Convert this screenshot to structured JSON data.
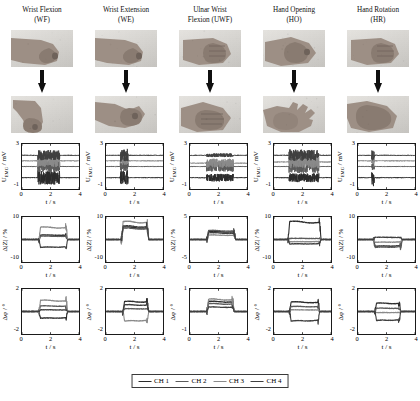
{
  "figure": {
    "columns": [
      {
        "id": "WF",
        "title_line1": "Wrist Flexion",
        "title_line2": "(WF)"
      },
      {
        "id": "WE",
        "title_line1": "Wrist Extension",
        "title_line2": "(WE)"
      },
      {
        "id": "UWF",
        "title_line1": "Ulnar Wrist",
        "title_line2": "Flexion (UWF)"
      },
      {
        "id": "HO",
        "title_line1": "Hand Opening",
        "title_line2": "(HO)"
      },
      {
        "id": "HR",
        "title_line1": "Hand Rotation",
        "title_line2": "(HR)"
      }
    ],
    "photo_rows": [
      {
        "name": "rest-posture",
        "cells": [
          "fist-side-rest",
          "fist-side-rest",
          "fist-front-rest",
          "fist-angled-rest",
          "fist-front-rest"
        ]
      },
      {
        "name": "gesture-posture",
        "cells": [
          "wrist-flexed-down",
          "wrist-extended-up",
          "ulnar-flexed-fist",
          "open-palm-hand",
          "rotated-fist"
        ]
      }
    ],
    "arrow_label": "transition-arrow",
    "legend": {
      "items": [
        {
          "label": "CH 1",
          "color": "#2b2b2b"
        },
        {
          "label": "CH 2",
          "color": "#5a5a5a"
        },
        {
          "label": "CH 3",
          "color": "#8a8a8a"
        },
        {
          "label": "CH 4",
          "color": "#3f3f3f"
        }
      ]
    }
  },
  "chart_data": [
    {
      "type": "line",
      "row": "emg",
      "column": "WF",
      "title": "",
      "xlabel": "t / s",
      "ylabel": "U_EMG / mV",
      "xlim": [
        0,
        4
      ],
      "ylim": [
        -1,
        3
      ],
      "xticks": [
        0,
        2,
        4
      ],
      "yticks": [
        -1,
        3
      ],
      "ytick_labels": [
        "-1",
        "3"
      ],
      "grid": false,
      "burst_window": [
        1.15,
        2.6
      ],
      "series": [
        {
          "name": "CH 1",
          "color": "#2b2b2b",
          "baseline": 0.0,
          "burst_amplitude": 0.55
        },
        {
          "name": "CH 2",
          "color": "#5a5a5a",
          "baseline": 1.0,
          "burst_amplitude": 0.45
        },
        {
          "name": "CH 3",
          "color": "#8a8a8a",
          "baseline": 1.5,
          "burst_amplitude": 0.5
        },
        {
          "name": "CH 4",
          "color": "#3f3f3f",
          "baseline": 2.0,
          "burst_amplitude": 0.4
        }
      ]
    },
    {
      "type": "line",
      "row": "emg",
      "column": "WE",
      "xlabel": "t / s",
      "ylabel": "U_EMG / mV",
      "xlim": [
        0,
        4
      ],
      "ylim": [
        -1,
        3
      ],
      "xticks": [
        0,
        2,
        4
      ],
      "ytick_labels": [
        "-1",
        "3"
      ],
      "burst_window": [
        1.05,
        1.5
      ],
      "series": [
        {
          "name": "CH 1",
          "color": "#2b2b2b",
          "baseline": 0.0,
          "burst_amplitude": 0.6
        },
        {
          "name": "CH 2",
          "color": "#5a5a5a",
          "baseline": 1.0,
          "burst_amplitude": 0.35
        },
        {
          "name": "CH 3",
          "color": "#8a8a8a",
          "baseline": 1.5,
          "burst_amplitude": 0.3
        },
        {
          "name": "CH 4",
          "color": "#3f3f3f",
          "baseline": 2.0,
          "burst_amplitude": 0.5
        }
      ]
    },
    {
      "type": "line",
      "row": "emg",
      "column": "UWF",
      "xlabel": "t / s",
      "ylabel": "U_EMG / mV",
      "xlim": [
        0,
        4
      ],
      "ylim": [
        -1,
        3
      ],
      "xticks": [
        0,
        2,
        4
      ],
      "ytick_labels": [
        "-1",
        "3"
      ],
      "burst_window": [
        1.2,
        3.0
      ],
      "series": [
        {
          "name": "CH 1",
          "color": "#2b2b2b",
          "baseline": 0.0,
          "burst_amplitude": 0.3
        },
        {
          "name": "CH 2",
          "color": "#5a5a5a",
          "baseline": 1.0,
          "burst_amplitude": 0.4
        },
        {
          "name": "CH 3",
          "color": "#8a8a8a",
          "baseline": 1.3,
          "burst_amplitude": 0.35
        },
        {
          "name": "CH 4",
          "color": "#3f3f3f",
          "baseline": 2.0,
          "burst_amplitude": 0.12
        }
      ]
    },
    {
      "type": "line",
      "row": "emg",
      "column": "HO",
      "xlabel": "t / s",
      "ylabel": "U_EMG / mV",
      "xlim": [
        0,
        4
      ],
      "ylim": [
        -1,
        3
      ],
      "xticks": [
        0,
        2,
        4
      ],
      "ytick_labels": [
        "-1",
        "3"
      ],
      "burst_window": [
        1.1,
        3.1
      ],
      "series": [
        {
          "name": "CH 1",
          "color": "#2b2b2b",
          "baseline": 0.0,
          "burst_amplitude": 0.35
        },
        {
          "name": "CH 2",
          "color": "#5a5a5a",
          "baseline": 1.0,
          "burst_amplitude": 0.55
        },
        {
          "name": "CH 3",
          "color": "#8a8a8a",
          "baseline": 1.4,
          "burst_amplitude": 0.5
        },
        {
          "name": "CH 4",
          "color": "#3f3f3f",
          "baseline": 2.0,
          "burst_amplitude": 0.45
        }
      ]
    },
    {
      "type": "line",
      "row": "emg",
      "column": "HR",
      "xlabel": "t / s",
      "ylabel": "U_EMG / mV",
      "xlim": [
        0,
        4
      ],
      "ylim": [
        -1,
        3
      ],
      "xticks": [
        0,
        2,
        4
      ],
      "ytick_labels": [
        "-1",
        "3"
      ],
      "burst_window": [
        1.0,
        1.1
      ],
      "series": [
        {
          "name": "CH 1",
          "color": "#2b2b2b",
          "baseline": 0.0,
          "burst_amplitude": 0.65
        },
        {
          "name": "CH 2",
          "color": "#5a5a5a",
          "baseline": 1.0,
          "burst_amplitude": 0.3
        },
        {
          "name": "CH 3",
          "color": "#8a8a8a",
          "baseline": 1.5,
          "burst_amplitude": 0.25
        },
        {
          "name": "CH 4",
          "color": "#3f3f3f",
          "baseline": 2.0,
          "burst_amplitude": 0.4
        }
      ]
    },
    {
      "type": "line",
      "row": "impedance",
      "column": "WF",
      "xlabel": "t / s",
      "ylabel": "Δ|Z| / %",
      "xlim": [
        0,
        4
      ],
      "ylim": [
        -10,
        10
      ],
      "xticks": [
        0,
        2,
        4
      ],
      "ytick_labels": [
        "-10",
        "10"
      ],
      "step_window": [
        1.2,
        3.1
      ],
      "series": [
        {
          "name": "CH 1",
          "color": "#2b2b2b",
          "plateau": 2.0
        },
        {
          "name": "CH 2",
          "color": "#5a5a5a",
          "plateau": 1.5
        },
        {
          "name": "CH 3",
          "color": "#8a8a8a",
          "plateau": 5.5
        },
        {
          "name": "CH 4",
          "color": "#3f3f3f",
          "plateau": -3.5
        }
      ]
    },
    {
      "type": "line",
      "row": "impedance",
      "column": "WE",
      "xlabel": "t / s",
      "ylabel": "Δ|Z| / %",
      "xlim": [
        0,
        4
      ],
      "ylim": [
        -10,
        10
      ],
      "xticks": [
        0,
        2,
        4
      ],
      "ytick_labels": [
        "-10",
        "10"
      ],
      "step_window": [
        1.1,
        2.9
      ],
      "series": [
        {
          "name": "CH 1",
          "color": "#2b2b2b",
          "plateau": 5.5
        },
        {
          "name": "CH 2",
          "color": "#5a5a5a",
          "plateau": 5.0
        },
        {
          "name": "CH 3",
          "color": "#8a8a8a",
          "plateau": 8.0
        },
        {
          "name": "CH 4",
          "color": "#3f3f3f",
          "plateau": 6.0
        }
      ]
    },
    {
      "type": "line",
      "row": "impedance",
      "column": "UWF",
      "xlabel": "t / s",
      "ylabel": "Δ|Z| / %",
      "xlim": [
        0,
        4
      ],
      "ylim": [
        -5,
        5
      ],
      "xticks": [
        0,
        2,
        4
      ],
      "ytick_labels": [
        "-5",
        "5"
      ],
      "step_window": [
        1.2,
        3.1
      ],
      "series": [
        {
          "name": "CH 1",
          "color": "#2b2b2b",
          "plateau": 1.8
        },
        {
          "name": "CH 2",
          "color": "#5a5a5a",
          "plateau": 2.0
        },
        {
          "name": "CH 3",
          "color": "#8a8a8a",
          "plateau": 1.0
        },
        {
          "name": "CH 4",
          "color": "#3f3f3f",
          "plateau": 1.5
        }
      ]
    },
    {
      "type": "line",
      "row": "impedance",
      "column": "HO",
      "xlabel": "t / s",
      "ylabel": "Δ|Z| / %",
      "xlim": [
        0,
        4
      ],
      "ylim": [
        -10,
        10
      ],
      "xticks": [
        0,
        2,
        4
      ],
      "ytick_labels": [
        "-10",
        "10"
      ],
      "step_window": [
        1.0,
        3.2
      ],
      "series": [
        {
          "name": "CH 1",
          "color": "#2b2b2b",
          "plateau": 8.0
        },
        {
          "name": "CH 2",
          "color": "#5a5a5a",
          "plateau": 0.5
        },
        {
          "name": "CH 3",
          "color": "#8a8a8a",
          "plateau": -1.0
        },
        {
          "name": "CH 4",
          "color": "#3f3f3f",
          "plateau": -2.0
        }
      ]
    },
    {
      "type": "line",
      "row": "impedance",
      "column": "HR",
      "xlabel": "t / s",
      "ylabel": "Δ|Z| / %",
      "xlim": [
        0,
        4
      ],
      "ylim": [
        -10,
        10
      ],
      "xticks": [
        0,
        2,
        4
      ],
      "ytick_labels": [
        "-10",
        "10"
      ],
      "step_window": [
        1.1,
        3.0
      ],
      "series": [
        {
          "name": "CH 1",
          "color": "#2b2b2b",
          "plateau": -3.0
        },
        {
          "name": "CH 2",
          "color": "#5a5a5a",
          "plateau": -3.5
        },
        {
          "name": "CH 3",
          "color": "#8a8a8a",
          "plateau": -1.2
        },
        {
          "name": "CH 4",
          "color": "#3f3f3f",
          "plateau": 1.0
        }
      ]
    },
    {
      "type": "line",
      "row": "phase",
      "column": "WF",
      "xlabel": "t / s",
      "ylabel": "Δφ / °",
      "xlim": [
        0,
        4
      ],
      "ylim": [
        -2,
        2
      ],
      "xticks": [
        0,
        2,
        4
      ],
      "ytick_labels": [
        "-2",
        "2"
      ],
      "step_window": [
        1.2,
        3.1
      ],
      "series": [
        {
          "name": "CH 1",
          "color": "#2b2b2b",
          "plateau": -0.6
        },
        {
          "name": "CH 2",
          "color": "#5a5a5a",
          "plateau": 0.5
        },
        {
          "name": "CH 3",
          "color": "#8a8a8a",
          "plateau": 1.0
        },
        {
          "name": "CH 4",
          "color": "#3f3f3f",
          "plateau": 0.15
        }
      ]
    },
    {
      "type": "line",
      "row": "phase",
      "column": "WE",
      "xlabel": "t / s",
      "ylabel": "Δφ / °",
      "xlim": [
        0,
        4
      ],
      "ylim": [
        -2,
        2
      ],
      "xticks": [
        0,
        2,
        4
      ],
      "ytick_labels": [
        "-2",
        "2"
      ],
      "step_window": [
        1.2,
        2.9
      ],
      "series": [
        {
          "name": "CH 1",
          "color": "#2b2b2b",
          "plateau": 0.9
        },
        {
          "name": "CH 2",
          "color": "#5a5a5a",
          "plateau": 0.25
        },
        {
          "name": "CH 3",
          "color": "#8a8a8a",
          "plateau": -0.85
        },
        {
          "name": "CH 4",
          "color": "#3f3f3f",
          "plateau": 0.6
        }
      ]
    },
    {
      "type": "line",
      "row": "phase",
      "column": "UWF",
      "xlabel": "t / s",
      "ylabel": "Δφ / °",
      "xlim": [
        0,
        4
      ],
      "ylim": [
        -1,
        1
      ],
      "xticks": [
        0,
        2,
        4
      ],
      "ytick_labels": [
        "-1",
        "1"
      ],
      "step_window": [
        1.2,
        3.0
      ],
      "series": [
        {
          "name": "CH 1",
          "color": "#2b2b2b",
          "plateau": 0.45
        },
        {
          "name": "CH 2",
          "color": "#5a5a5a",
          "plateau": 0.35
        },
        {
          "name": "CH 3",
          "color": "#8a8a8a",
          "plateau": 0.55
        },
        {
          "name": "CH 4",
          "color": "#3f3f3f",
          "plateau": 0.2
        }
      ]
    },
    {
      "type": "line",
      "row": "phase",
      "column": "HO",
      "xlabel": "t / s",
      "ylabel": "Δφ / °",
      "xlim": [
        0,
        4
      ],
      "ylim": [
        -2,
        2
      ],
      "xticks": [
        0,
        2,
        4
      ],
      "ytick_labels": [
        "-2",
        "2"
      ],
      "step_window": [
        1.1,
        3.1
      ],
      "series": [
        {
          "name": "CH 1",
          "color": "#2b2b2b",
          "plateau": 0.85
        },
        {
          "name": "CH 2",
          "color": "#5a5a5a",
          "plateau": 0.45
        },
        {
          "name": "CH 3",
          "color": "#8a8a8a",
          "plateau": 0.15
        },
        {
          "name": "CH 4",
          "color": "#3f3f3f",
          "plateau": -0.85
        }
      ]
    },
    {
      "type": "line",
      "row": "phase",
      "column": "HR",
      "xlabel": "t / s",
      "ylabel": "Δφ / °",
      "xlim": [
        0,
        4
      ],
      "ylim": [
        -2,
        2
      ],
      "xticks": [
        0,
        2,
        4
      ],
      "ytick_labels": [
        "-2",
        "2"
      ],
      "step_window": [
        1.2,
        2.9
      ],
      "series": [
        {
          "name": "CH 1",
          "color": "#2b2b2b",
          "plateau": 0.75
        },
        {
          "name": "CH 2",
          "color": "#5a5a5a",
          "plateau": 0.3
        },
        {
          "name": "CH 3",
          "color": "#8a8a8a",
          "plateau": -0.1
        },
        {
          "name": "CH 4",
          "color": "#3f3f3f",
          "plateau": -0.8
        }
      ]
    }
  ]
}
